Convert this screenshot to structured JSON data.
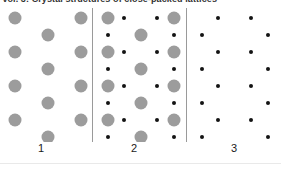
{
  "caption": {
    "text": "Vol. 3: Crystal structures of close-packed lattices"
  },
  "figure": {
    "background_color": "#ffffff",
    "divider_color": "#9a9a9a",
    "large_site_color": "#9c9c9c",
    "small_site_color": "#131313",
    "large_site_diameter_px": 13,
    "small_site_diameter_px": 4
  },
  "panels": [
    {
      "label": "1",
      "description": "large-gray-sublattice-only",
      "large_sites": [
        {
          "x": 15,
          "y": 10
        },
        {
          "x": 81,
          "y": 10
        },
        {
          "x": 48,
          "y": 27
        },
        {
          "x": 15,
          "y": 44
        },
        {
          "x": 81,
          "y": 44
        },
        {
          "x": 48,
          "y": 61
        },
        {
          "x": 15,
          "y": 78
        },
        {
          "x": 81,
          "y": 78
        },
        {
          "x": 48,
          "y": 95
        },
        {
          "x": 15,
          "y": 112
        },
        {
          "x": 81,
          "y": 112
        },
        {
          "x": 48,
          "y": 129
        }
      ],
      "small_sites": []
    },
    {
      "label": "2",
      "description": "combined-lattice-gray-and-black",
      "large_sites": [
        {
          "x": 15,
          "y": 10
        },
        {
          "x": 81,
          "y": 10
        },
        {
          "x": 48,
          "y": 27
        },
        {
          "x": 15,
          "y": 44
        },
        {
          "x": 81,
          "y": 44
        },
        {
          "x": 48,
          "y": 61
        },
        {
          "x": 15,
          "y": 78
        },
        {
          "x": 81,
          "y": 78
        },
        {
          "x": 48,
          "y": 95
        },
        {
          "x": 15,
          "y": 112
        },
        {
          "x": 81,
          "y": 112
        },
        {
          "x": 48,
          "y": 129
        }
      ],
      "small_sites": [
        {
          "x": 31,
          "y": 10
        },
        {
          "x": 64,
          "y": 10
        },
        {
          "x": 15,
          "y": 27
        },
        {
          "x": 81,
          "y": 27
        },
        {
          "x": 31,
          "y": 44
        },
        {
          "x": 64,
          "y": 44
        },
        {
          "x": 15,
          "y": 61
        },
        {
          "x": 81,
          "y": 61
        },
        {
          "x": 31,
          "y": 78
        },
        {
          "x": 64,
          "y": 78
        },
        {
          "x": 15,
          "y": 95
        },
        {
          "x": 81,
          "y": 95
        },
        {
          "x": 31,
          "y": 112
        },
        {
          "x": 64,
          "y": 112
        },
        {
          "x": 15,
          "y": 129
        },
        {
          "x": 81,
          "y": 129
        }
      ]
    },
    {
      "label": "3",
      "description": "small-black-sublattice-only",
      "large_sites": [],
      "small_sites": [
        {
          "x": 31,
          "y": 10
        },
        {
          "x": 64,
          "y": 10
        },
        {
          "x": 15,
          "y": 27
        },
        {
          "x": 81,
          "y": 27
        },
        {
          "x": 31,
          "y": 44
        },
        {
          "x": 64,
          "y": 44
        },
        {
          "x": 15,
          "y": 61
        },
        {
          "x": 81,
          "y": 61
        },
        {
          "x": 31,
          "y": 78
        },
        {
          "x": 64,
          "y": 78
        },
        {
          "x": 15,
          "y": 95
        },
        {
          "x": 81,
          "y": 95
        },
        {
          "x": 31,
          "y": 112
        },
        {
          "x": 64,
          "y": 112
        },
        {
          "x": 15,
          "y": 129
        },
        {
          "x": 81,
          "y": 129
        }
      ]
    }
  ]
}
